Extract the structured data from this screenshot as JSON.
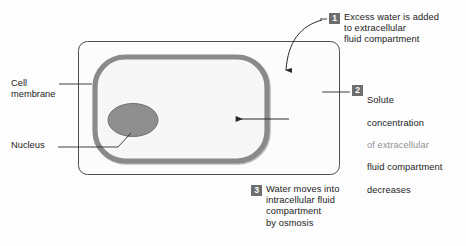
{
  "figure": {
    "background_color": "#fdfdfd"
  },
  "colors": {
    "marker_fill": "#6e6e6e",
    "marker_text": "#ffffff",
    "text": "#1c1c1c",
    "compartment_outline": "#3a3a3a",
    "membrane": "#8a8a8a",
    "membrane_shadow": "#9b9b9b",
    "cell_interior": "#f7f7f7",
    "nucleus_fill": "#8f8f8f",
    "nucleus_outline": "#6f6f6f",
    "leader_line": "#2b2b2b",
    "arrow": "#2b2b2b"
  },
  "diagram": {
    "compartment_name": "extracellular fluid compartment",
    "cell_name": "cell",
    "labels": [
      {
        "id": "cell-membrane",
        "text": "Cell\nmembrane"
      },
      {
        "id": "nucleus",
        "text": "Nucleus"
      }
    ],
    "arrows": [
      {
        "id": "water-entry-arrow",
        "kind": "curved",
        "direction": "down-into-compartment"
      },
      {
        "id": "osmosis-arrow",
        "kind": "straight",
        "direction": "left-into-cell"
      }
    ]
  },
  "callouts": [
    {
      "id": "callout-1",
      "number": "1",
      "text": "Excess water is added\nto extracellular\nfluid compartment",
      "lines": [
        "Excess water is added",
        "to extracellular",
        "fluid compartment"
      ]
    },
    {
      "id": "callout-2",
      "number": "2",
      "text": "Solute\nconcentration\nof extracellular\nfluid compartment\ndecreases",
      "lines": [
        "Solute",
        "concentration",
        "of extracellular",
        "fluid compartment",
        "decreases"
      ]
    },
    {
      "id": "callout-3",
      "number": "3",
      "text": "Water moves into\nintracellular fluid\ncompartment\nby osmosis",
      "lines": [
        "Water moves into",
        "intracellular fluid",
        "compartment",
        "by osmosis"
      ]
    }
  ]
}
